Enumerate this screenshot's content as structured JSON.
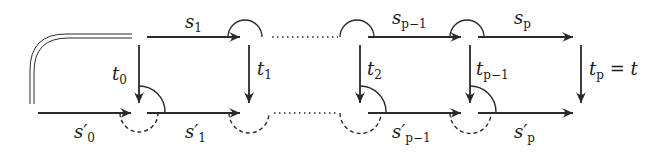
{
  "diagram": {
    "type": "commutative-diagram",
    "colors": {
      "stroke": "#2a2a2a",
      "background": "#ffffff"
    },
    "top_row": {
      "labels": [
        {
          "base": "s",
          "sub": "1"
        },
        {
          "base": "s",
          "sub": "p−1"
        },
        {
          "base": "s",
          "sub": "p"
        }
      ]
    },
    "bottom_row": {
      "labels": [
        {
          "base": "s′",
          "sub": "0"
        },
        {
          "base": "s′",
          "sub": "1"
        },
        {
          "base": "s′",
          "sub": "p−1"
        },
        {
          "base": "s′",
          "sub": "p"
        }
      ]
    },
    "vertical_arrows": [
      {
        "base": "t",
        "sub": "0"
      },
      {
        "base": "t",
        "sub": "1"
      },
      {
        "base": "t",
        "sub": "2"
      },
      {
        "base": "t",
        "sub": "p−1"
      },
      {
        "base": "t",
        "sub": "p",
        "suffix": " = t"
      }
    ]
  }
}
